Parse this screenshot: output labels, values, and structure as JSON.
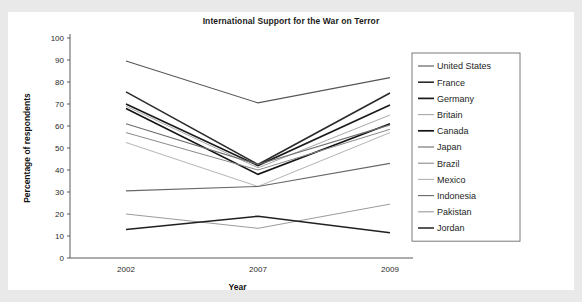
{
  "chart_data": {
    "type": "line",
    "title": "International Support for the War on Terror",
    "xlabel": "Year",
    "ylabel": "Percentage of respondents",
    "x": [
      "2002",
      "2007",
      "2009"
    ],
    "categories": [
      "2002",
      "2007",
      "2009"
    ],
    "xtick_labels": [
      "2002",
      "2007",
      "2009"
    ],
    "ytick_labels": [
      "0",
      "10",
      "20",
      "30",
      "40",
      "50",
      "60",
      "70",
      "80",
      "90",
      "100"
    ],
    "ylim": [
      0,
      100
    ],
    "ytick_step": 10,
    "grid": false,
    "legend_position": "right",
    "series": [
      {
        "name": "United States",
        "values": [
          89.5,
          70.5,
          82.0
        ],
        "color": "#555555",
        "width": 1.1
      },
      {
        "name": "France",
        "values": [
          75.5,
          42.5,
          75.0
        ],
        "color": "#2b2b2b",
        "width": 1.6
      },
      {
        "name": "Germany",
        "values": [
          70.0,
          42.0,
          69.5
        ],
        "color": "#1a1a1a",
        "width": 1.7
      },
      {
        "name": "Britain",
        "values": [
          69.0,
          41.0,
          65.0
        ],
        "color": "#a8a8a8",
        "width": 1.0
      },
      {
        "name": "Canada",
        "values": [
          68.0,
          38.0,
          61.0
        ],
        "color": "#141414",
        "width": 1.7
      },
      {
        "name": "Japan",
        "values": [
          61.0,
          42.5,
          60.5
        ],
        "color": "#6e6e6e",
        "width": 1.1
      },
      {
        "name": "Brazil",
        "values": [
          57.0,
          40.0,
          58.5
        ],
        "color": "#8a8a8a",
        "width": 1.0
      },
      {
        "name": "Mexico",
        "values": [
          52.5,
          32.5,
          57.0
        ],
        "color": "#b4b4b4",
        "width": 1.0
      },
      {
        "name": "Indonesia",
        "values": [
          30.5,
          32.5,
          43.0
        ],
        "color": "#676767",
        "width": 1.1
      },
      {
        "name": "Pakistan",
        "values": [
          20.0,
          13.5,
          24.5
        ],
        "color": "#9b9b9b",
        "width": 1.0
      },
      {
        "name": "Jordan",
        "values": [
          13.0,
          19.0,
          11.5
        ],
        "color": "#202020",
        "width": 1.5
      }
    ]
  },
  "legend": {
    "items": [
      "United States",
      "France",
      "Germany",
      "Britain",
      "Canada",
      "Japan",
      "Brazil",
      "Mexico",
      "Indonesia",
      "Pakistan",
      "Jordan"
    ]
  },
  "colors": {
    "page_background": "#e9e9e9",
    "canvas_background": "#ffffff",
    "axis": "#5b5b5b",
    "text": "#1b1b1b",
    "legend_border": "#7a7a7a"
  }
}
